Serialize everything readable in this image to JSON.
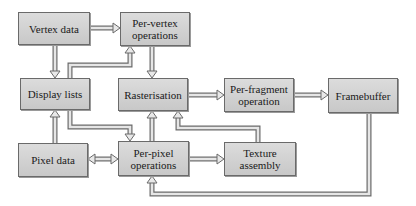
{
  "diagram": {
    "type": "flowchart",
    "title": "",
    "nodes": [
      {
        "id": "vertex_data",
        "label": "Vertex data"
      },
      {
        "id": "per_vertex",
        "label": "Per-vertex operations"
      },
      {
        "id": "display_lists",
        "label": "Display lists"
      },
      {
        "id": "rasterisation",
        "label": "Rasterisation"
      },
      {
        "id": "per_fragment",
        "label": "Per-fragment operation"
      },
      {
        "id": "framebuffer",
        "label": "Framebuffer"
      },
      {
        "id": "pixel_data",
        "label": "Pixel data"
      },
      {
        "id": "per_pixel",
        "label": "Per-pixel operations"
      },
      {
        "id": "texture_assembly",
        "label": "Texture assembly"
      }
    ],
    "edges": [
      {
        "from": "vertex_data",
        "to": "per_vertex"
      },
      {
        "from": "vertex_data",
        "to": "display_lists"
      },
      {
        "from": "display_lists",
        "to": "per_vertex"
      },
      {
        "from": "per_vertex",
        "to": "rasterisation"
      },
      {
        "from": "rasterisation",
        "to": "per_fragment"
      },
      {
        "from": "per_fragment",
        "to": "framebuffer"
      },
      {
        "from": "display_lists",
        "to": "per_pixel"
      },
      {
        "from": "pixel_data",
        "to": "display_lists"
      },
      {
        "from": "pixel_data",
        "to": "per_pixel",
        "bidirectional": true
      },
      {
        "from": "per_pixel",
        "to": "rasterisation"
      },
      {
        "from": "per_pixel",
        "to": "texture_assembly"
      },
      {
        "from": "texture_assembly",
        "to": "rasterisation"
      },
      {
        "from": "framebuffer",
        "to": "per_pixel"
      }
    ]
  },
  "labels": {
    "vertex_data": "Vertex data",
    "per_vertex_1": "Per-vertex",
    "per_vertex_2": "operations",
    "display_lists": "Display lists",
    "rasterisation": "Rasterisation",
    "per_fragment_1": "Per-fragment",
    "per_fragment_2": "operation",
    "framebuffer": "Framebuffer",
    "pixel_data": "Pixel data",
    "per_pixel_1": "Per-pixel",
    "per_pixel_2": "operations",
    "texture_1": "Texture",
    "texture_2": "assembly"
  }
}
